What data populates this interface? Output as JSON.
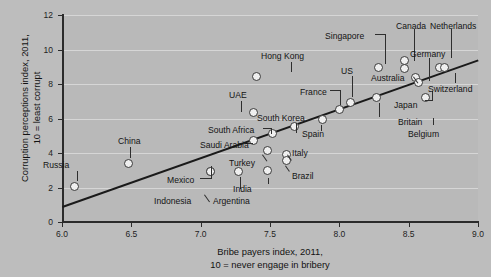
{
  "chart_data": {
    "type": "scatter",
    "title": "",
    "xlabel": "Bribe payers index, 2011,\n10 = never engage in bribery",
    "xlabel_line1": "Bribe payers index, 2011,",
    "xlabel_line2": "10 = never engage in bribery",
    "ylabel_line1": "Corruption perceptions index, 2011,",
    "ylabel_line2": "10 = least corrupt",
    "xlim": [
      6.0,
      9.0
    ],
    "ylim": [
      0,
      12
    ],
    "xticks": [
      "6.0",
      "6.5",
      "7.0",
      "7.5",
      "8.0",
      "8.5",
      "9.0"
    ],
    "yticks": [
      "0",
      "2",
      "4",
      "6",
      "8",
      "10",
      "12"
    ],
    "grid": "horizontal",
    "legend": "none",
    "trendline": {
      "x1": 6.0,
      "y1": 0.9,
      "x2": 9.0,
      "y2": 9.4
    },
    "points": [
      {
        "label": "Russia",
        "x": 6.09,
        "y": 2.05,
        "lx": 43,
        "ly": 160,
        "lead": [
          [
            77,
            171,
            10,
            "v"
          ]
        ]
      },
      {
        "label": "China",
        "x": 6.48,
        "y": 3.42,
        "lx": 118,
        "ly": 136,
        "lead": [
          [
            130,
            147,
            11,
            "v"
          ]
        ]
      },
      {
        "label": "Mexico",
        "x": 7.07,
        "y": 2.92,
        "lx": 167,
        "ly": 175,
        "lead": [
          [
            200,
            178,
            12,
            "h"
          ],
          [
            211,
            166,
            12,
            "v"
          ]
        ]
      },
      {
        "label": "Indonesia",
        "x": 7.07,
        "y": 2.92,
        "lx": 154,
        "ly": 196,
        "lead": [
          [
            204,
            195,
            9,
            "d"
          ]
        ]
      },
      {
        "label": "Argentina",
        "x": 7.27,
        "y": 2.9,
        "lx": 213,
        "ly": 196,
        "lead": [
          [
            240,
            177,
            12,
            "v"
          ]
        ]
      },
      {
        "label": "Turkey",
        "x": 7.48,
        "y": 4.15,
        "lx": 229,
        "ly": 158,
        "lead": [
          [
            262,
            155,
            8,
            "d"
          ]
        ]
      },
      {
        "label": "India",
        "x": 7.48,
        "y": 3.0,
        "lx": 233,
        "ly": 184,
        "lead": [
          [
            268,
            178,
            6,
            "v"
          ]
        ]
      },
      {
        "label": "Saudi Arabia",
        "x": 7.38,
        "y": 4.7,
        "lx": 200,
        "ly": 140,
        "lead": [
          [
            243,
            143,
            10,
            "h"
          ]
        ]
      },
      {
        "label": "South Africa",
        "x": 7.52,
        "y": 5.12,
        "lx": 208,
        "ly": 125,
        "lead": [
          [
            263,
            128,
            9,
            "h"
          ],
          [
            271,
            128,
            6,
            "v"
          ]
        ]
      },
      {
        "label": "Italy",
        "x": 7.62,
        "y": 3.92,
        "lx": 292,
        "ly": 148,
        "lead": [
          [
            287,
            155,
            7,
            "d"
          ]
        ]
      },
      {
        "label": "Brazil",
        "x": 7.62,
        "y": 3.55,
        "lx": 292,
        "ly": 171,
        "lead": [
          [
            285,
            166,
            7,
            "d"
          ]
        ]
      },
      {
        "label": "South Korea",
        "x": 7.68,
        "y": 5.55,
        "lx": 257,
        "ly": 113,
        "lead": [
          [
            296,
            123,
            10,
            "v"
          ]
        ]
      },
      {
        "label": "UAE",
        "x": 7.38,
        "y": 6.35,
        "lx": 229,
        "ly": 90,
        "lead": [
          [
            241,
            101,
            11,
            "v"
          ]
        ]
      },
      {
        "label": "Hong Kong",
        "x": 7.4,
        "y": 8.45,
        "lx": 261,
        "ly": 51,
        "lead": [
          [
            291,
            62,
            10,
            "v"
          ]
        ]
      },
      {
        "label": "Spain",
        "x": 7.88,
        "y": 5.95,
        "lx": 302,
        "ly": 129,
        "lead": [
          [
            321,
            125,
            6,
            "v"
          ]
        ]
      },
      {
        "label": "France",
        "x": 8.0,
        "y": 6.5,
        "lx": 300,
        "ly": 87,
        "lead": [
          [
            330,
            90,
            10,
            "h"
          ],
          [
            340,
            90,
            15,
            "v"
          ]
        ]
      },
      {
        "label": "US",
        "x": 8.08,
        "y": 6.9,
        "lx": 341,
        "ly": 66,
        "lead": [
          [
            352,
            76,
            21,
            "v"
          ]
        ]
      },
      {
        "label": "Britain",
        "x": 8.27,
        "y": 7.22,
        "lx": 398,
        "ly": 117,
        "lead": [
          [
            379,
            103,
            14,
            "v"
          ]
        ]
      },
      {
        "label": "Singapore",
        "x": 8.28,
        "y": 8.95,
        "lx": 325,
        "ly": 31,
        "lead": [
          [
            375,
            34,
            10,
            "h"
          ],
          [
            385,
            34,
            30,
            "v"
          ]
        ]
      },
      {
        "label": "Australia",
        "x": 8.47,
        "y": 8.92,
        "lx": 371,
        "ly": 73,
        "lead": [
          [
            413,
            77,
            8,
            "d"
          ]
        ]
      },
      {
        "label": "Canada",
        "x": 8.47,
        "y": 9.35,
        "lx": 396,
        "ly": 21,
        "lead": [
          [
            414,
            29,
            32,
            "v"
          ]
        ]
      },
      {
        "label": "Germany",
        "x": 8.55,
        "y": 8.4,
        "lx": 410,
        "ly": 49,
        "lead": [
          [
            429,
            58,
            23,
            "v"
          ]
        ]
      },
      {
        "label": "Japan",
        "x": 8.57,
        "y": 8.1,
        "lx": 394,
        "ly": 100,
        "lead": [
          [
            425,
            100,
            8,
            "h"
          ],
          [
            432,
            91,
            9,
            "v"
          ]
        ]
      },
      {
        "label": "Belgium",
        "x": 8.62,
        "y": 7.22,
        "lx": 408,
        "ly": 129,
        "lead": [
          [
            433,
            118,
            7,
            "v"
          ]
        ]
      },
      {
        "label": "Netherlands",
        "x": 8.72,
        "y": 8.98,
        "lx": 430,
        "ly": 21,
        "lead": [
          [
            451,
            29,
            29,
            "v"
          ]
        ]
      },
      {
        "label": "Switzerland",
        "x": 8.76,
        "y": 8.95,
        "lx": 428,
        "ly": 84,
        "lead": [
          [
            455,
            73,
            10,
            "v"
          ]
        ]
      }
    ]
  }
}
